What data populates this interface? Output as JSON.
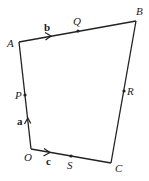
{
  "diagram": {
    "type": "vector-quadrilateral",
    "colors": {
      "stroke": "#222222",
      "background": "#ffffff"
    },
    "vertices": [
      {
        "id": "O",
        "label": "O",
        "x": 31,
        "y": 149
      },
      {
        "id": "A",
        "label": "A",
        "x": 19,
        "y": 42
      },
      {
        "id": "B",
        "label": "B",
        "x": 136,
        "y": 21
      },
      {
        "id": "C",
        "label": "C",
        "x": 111,
        "y": 163
      }
    ],
    "midpoints": [
      {
        "id": "P",
        "label": "P",
        "on": "OA",
        "x": 25,
        "y": 95
      },
      {
        "id": "Q",
        "label": "Q",
        "on": "AB",
        "x": 78,
        "y": 31
      },
      {
        "id": "R",
        "label": "R",
        "on": "BC",
        "x": 124,
        "y": 91
      },
      {
        "id": "S",
        "label": "S",
        "on": "OC",
        "x": 71,
        "y": 156
      }
    ],
    "vectors": [
      {
        "label": "a",
        "edge": "OA"
      },
      {
        "label": "b",
        "edge": "AB"
      },
      {
        "label": "c",
        "edge": "OC"
      }
    ]
  }
}
